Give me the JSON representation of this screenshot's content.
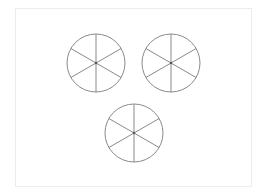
{
  "diagram": {
    "stroke_color": "#8a8a8a",
    "frame_color": "#ececec",
    "circles": [
      {
        "cx": 96,
        "cy": 63,
        "r": 29,
        "parts": 6
      },
      {
        "cx": 171,
        "cy": 63,
        "r": 29,
        "parts": 6
      },
      {
        "cx": 134,
        "cy": 133,
        "r": 29,
        "parts": 6
      }
    ]
  }
}
